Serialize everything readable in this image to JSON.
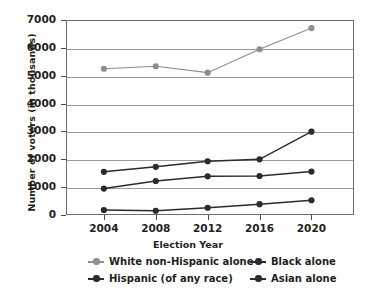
{
  "chart_data": {
    "type": "line",
    "title": "",
    "xlabel": "Election Year",
    "ylabel": "Number of voters (in thousands)",
    "categories": [
      "2004",
      "2008",
      "2012",
      "2016",
      "2020"
    ],
    "x_tick_labels": [
      "2004",
      "2008",
      "2012",
      "2016",
      "2020"
    ],
    "y_tick_labels": [
      "0",
      "1000",
      "2000",
      "3000",
      "4000",
      "5000",
      "6000",
      "7000"
    ],
    "y_ticks": [
      0,
      1000,
      2000,
      3000,
      4000,
      5000,
      6000,
      7000
    ],
    "ylim": [
      0,
      7000
    ],
    "grid": "horizontal",
    "legend_position": "bottom",
    "series": [
      {
        "name": "White non-Hispanic alone",
        "color": "#8e8e8e",
        "values": [
          5250,
          5340,
          5110,
          5950,
          6710
        ]
      },
      {
        "name": "Black alone",
        "color": "#2b2b2b",
        "values": [
          1550,
          1730,
          1930,
          2000,
          2990
        ]
      },
      {
        "name": "Hispanic (of any race)",
        "color": "#2b2b2b",
        "values": [
          950,
          1220,
          1390,
          1400,
          1560
        ]
      },
      {
        "name": "Asian alone",
        "color": "#2b2b2b",
        "values": [
          180,
          150,
          260,
          390,
          530
        ]
      }
    ],
    "legend_entries": [
      {
        "label": "White non-Hispanic alone",
        "color": "#8e8e8e"
      },
      {
        "label": "Black alone",
        "color": "#2b2b2b"
      },
      {
        "label": "Hispanic (of any race)",
        "color": "#2b2b2b"
      },
      {
        "label": "Asian alone",
        "color": "#2b2b2b"
      }
    ],
    "axis_color": "#6e6e6e",
    "gridline_color": "#9a9a9a",
    "background_color": "#ffffff"
  }
}
